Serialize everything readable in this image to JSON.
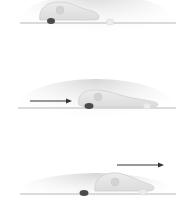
{
  "diagram": {
    "colors": {
      "background": "#ffffff",
      "substrate_line": "#b5b5b5",
      "substrate_shadow": "#d9d9d9",
      "cell_body": "#e4e4e4",
      "cell_outline": "#cfcfcf",
      "nucleus": "#d2d2d2",
      "rear_blob": "#4a4a4a",
      "front_blob": "#ececec",
      "arrow": "#333333"
    },
    "frames": [
      {
        "id": "stage-1",
        "label": "",
        "arrow": "none"
      },
      {
        "id": "stage-2",
        "label": "",
        "arrow": "left-pointing-right"
      },
      {
        "id": "stage-3",
        "label": "",
        "arrow": "upper-right-pointing-right"
      }
    ]
  }
}
